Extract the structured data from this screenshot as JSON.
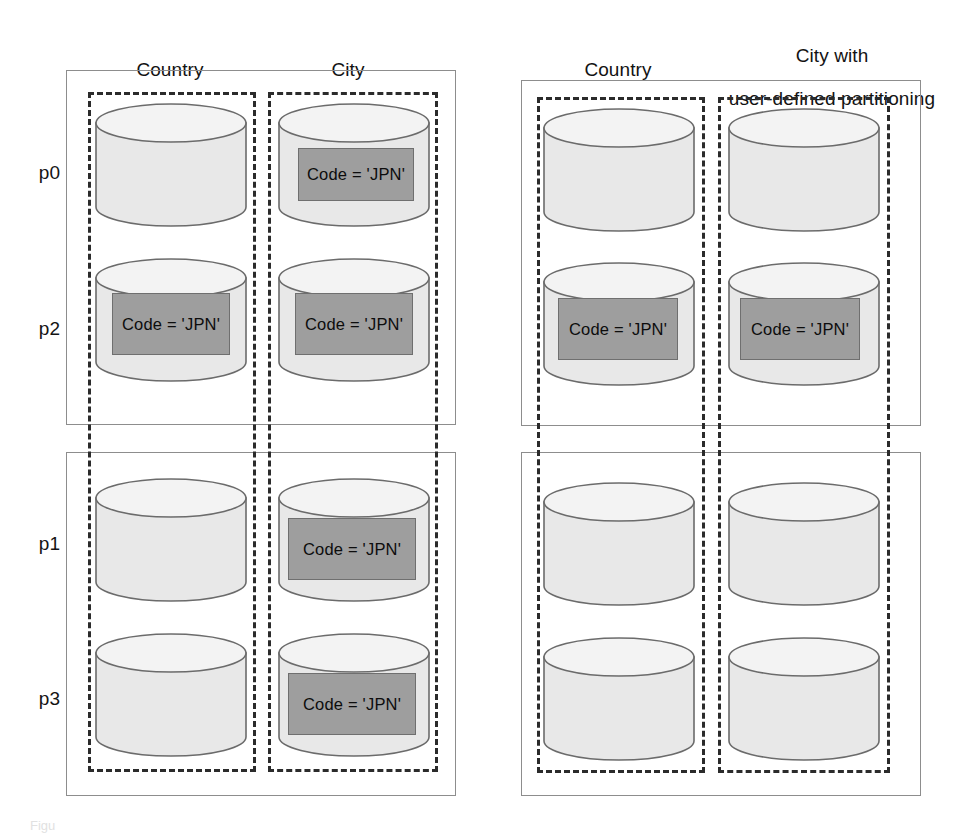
{
  "figure": {
    "width": 955,
    "height": 837,
    "background": "#ffffff",
    "caption_remnant": "Figu"
  },
  "colors": {
    "cylinder_body": "#e8e8e8",
    "cylinder_top": "#f2f2f2",
    "cylinder_stroke": "#6b6b6b",
    "jpn_fill": "#9e9e9e",
    "jpn_stroke": "#6f6f6f",
    "solid_box_stroke": "#8d8d8d",
    "dashed_stroke": "#2b2b2b",
    "text": "#131313"
  },
  "groups": [
    {
      "id": "left-group",
      "name": "hash-partitioned-tables",
      "columns": [
        {
          "id": "left-country",
          "label": "Country"
        },
        {
          "id": "left-city",
          "label": "City"
        }
      ],
      "panels": [
        {
          "id": "left-top-panel",
          "rows": [
            {
              "label": "p0",
              "cells": [
                {
                  "column": "Country",
                  "has_predicate": false,
                  "predicate": ""
                },
                {
                  "column": "City",
                  "has_predicate": true,
                  "predicate": "Code = 'JPN'",
                  "predicate_position": "upper"
                }
              ]
            },
            {
              "label": "p2",
              "cells": [
                {
                  "column": "Country",
                  "has_predicate": true,
                  "predicate": "Code = 'JPN'",
                  "predicate_position": "lower"
                },
                {
                  "column": "City",
                  "has_predicate": true,
                  "predicate": "Code = 'JPN'",
                  "predicate_position": "lower"
                }
              ]
            }
          ]
        },
        {
          "id": "left-bottom-panel",
          "rows": [
            {
              "label": "p1",
              "cells": [
                {
                  "column": "Country",
                  "has_predicate": false,
                  "predicate": ""
                },
                {
                  "column": "City",
                  "has_predicate": true,
                  "predicate": "Code = 'JPN'",
                  "predicate_position": "upper"
                }
              ]
            },
            {
              "label": "p3",
              "cells": [
                {
                  "column": "Country",
                  "has_predicate": false,
                  "predicate": ""
                },
                {
                  "column": "City",
                  "has_predicate": true,
                  "predicate": "Code = 'JPN'",
                  "predicate_position": "lower"
                }
              ]
            }
          ]
        }
      ]
    },
    {
      "id": "right-group",
      "name": "user-defined-partitioned-tables",
      "columns": [
        {
          "id": "right-country",
          "label": "Country"
        },
        {
          "id": "right-city",
          "label": "City with\nuser-defined partitioning"
        }
      ],
      "panels": [
        {
          "id": "right-top-panel",
          "rows": [
            {
              "label": "p0",
              "cells": [
                {
                  "column": "Country",
                  "has_predicate": false,
                  "predicate": ""
                },
                {
                  "column": "City with user-defined partitioning",
                  "has_predicate": false,
                  "predicate": ""
                }
              ]
            },
            {
              "label": "p2",
              "cells": [
                {
                  "column": "Country",
                  "has_predicate": true,
                  "predicate": "Code = 'JPN'",
                  "predicate_position": "lower"
                },
                {
                  "column": "City with user-defined partitioning",
                  "has_predicate": true,
                  "predicate": "Code = 'JPN'",
                  "predicate_position": "lower"
                }
              ]
            }
          ]
        },
        {
          "id": "right-bottom-panel",
          "rows": [
            {
              "label": "p1",
              "cells": [
                {
                  "column": "Country",
                  "has_predicate": false,
                  "predicate": ""
                },
                {
                  "column": "City with user-defined partitioning",
                  "has_predicate": false,
                  "predicate": ""
                }
              ]
            },
            {
              "label": "p3",
              "cells": [
                {
                  "column": "Country",
                  "has_predicate": false,
                  "predicate": ""
                },
                {
                  "column": "City with user-defined partitioning",
                  "has_predicate": false,
                  "predicate": ""
                }
              ]
            }
          ]
        }
      ]
    }
  ],
  "headers": {
    "left_country": "Country",
    "left_city": "City",
    "right_country": "Country",
    "right_city_line1": "City with",
    "right_city_line2": "user-defined partitioning"
  },
  "row_labels": {
    "r0": "p0",
    "r1": "p2",
    "r2": "p1",
    "r3": "p3"
  },
  "predicate_text": "Code = 'JPN'"
}
